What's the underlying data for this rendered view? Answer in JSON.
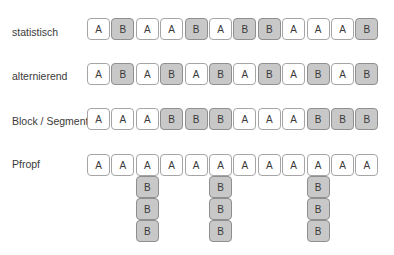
{
  "colors": {
    "a_fill": "#ffffff",
    "b_fill": "#c8c8c8",
    "border_a": "#a5a5a5",
    "border_b": "#8f8f8f",
    "text": "#3a3a3a"
  },
  "rows": [
    {
      "label": "statistisch",
      "sequence": [
        "A",
        "B",
        "A",
        "A",
        "B",
        "A",
        "B",
        "B",
        "A",
        "A",
        "A",
        "B"
      ]
    },
    {
      "label": "alternierend",
      "sequence": [
        "A",
        "B",
        "A",
        "B",
        "A",
        "B",
        "A",
        "B",
        "A",
        "B",
        "A",
        "B"
      ]
    },
    {
      "label": "Block / Segment",
      "sequence": [
        "A",
        "A",
        "A",
        "B",
        "B",
        "B",
        "A",
        "A",
        "A",
        "B",
        "B",
        "B"
      ]
    },
    {
      "label": "Pfropf",
      "sequence": [
        "A",
        "A",
        "A",
        "A",
        "A",
        "A",
        "A",
        "A",
        "A",
        "A",
        "A",
        "A"
      ],
      "branches": [
        {
          "position": 3,
          "sequence": [
            "B",
            "B",
            "B"
          ]
        },
        {
          "position": 6,
          "sequence": [
            "B",
            "B",
            "B"
          ]
        },
        {
          "position": 10,
          "sequence": [
            "B",
            "B",
            "B"
          ]
        }
      ]
    }
  ]
}
